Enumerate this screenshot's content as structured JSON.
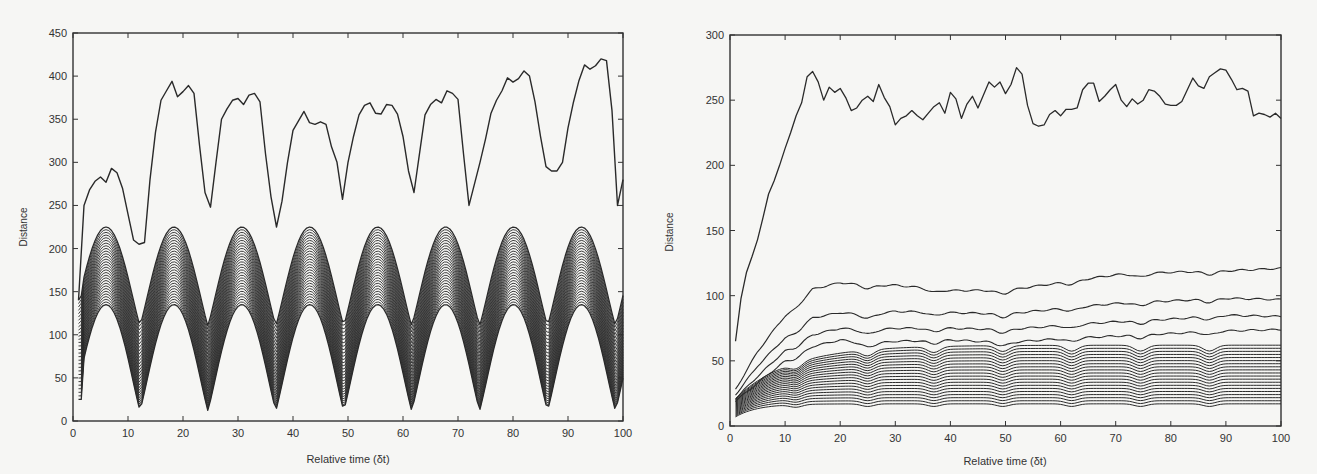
{
  "chart_data": [
    {
      "type": "line",
      "title": "",
      "xlabel": "Relative time (δt)",
      "ylabel": "Distance",
      "xlim": [
        0,
        100
      ],
      "ylim": [
        0,
        450
      ],
      "xticks": [
        0,
        10,
        20,
        30,
        40,
        50,
        60,
        70,
        80,
        90,
        100
      ],
      "yticks": [
        0,
        50,
        100,
        150,
        200,
        250,
        300,
        350,
        400,
        450
      ],
      "grid": false,
      "legend": null,
      "series": [
        {
          "name": "top curve",
          "x": [
            1,
            2,
            3,
            4,
            5,
            6,
            7,
            8,
            9,
            10,
            11,
            12,
            13,
            14,
            15,
            16,
            17,
            18,
            19,
            20,
            21,
            22,
            23,
            24,
            25,
            26,
            27,
            28,
            29,
            30,
            31,
            32,
            33,
            34,
            35,
            36,
            37,
            38,
            39,
            40,
            41,
            42,
            43,
            44,
            45,
            46,
            47,
            48,
            49,
            50,
            51,
            52,
            53,
            54,
            55,
            56,
            57,
            58,
            59,
            60,
            61,
            62,
            63,
            64,
            65,
            66,
            67,
            68,
            69,
            70,
            71,
            72,
            73,
            74,
            75,
            76,
            77,
            78,
            79,
            80,
            81,
            82,
            83,
            84,
            85,
            86,
            87,
            88,
            89,
            90,
            91,
            92,
            93,
            94,
            95,
            96,
            97,
            98,
            99,
            100
          ],
          "values": [
            140,
            250,
            268,
            278,
            283,
            277,
            293,
            288,
            270,
            240,
            210,
            205,
            207,
            280,
            335,
            372,
            383,
            394,
            376,
            382,
            389,
            380,
            320,
            265,
            248,
            300,
            350,
            362,
            372,
            374,
            367,
            378,
            380,
            370,
            310,
            260,
            225,
            255,
            300,
            337,
            348,
            359,
            346,
            344,
            347,
            344,
            318,
            300,
            257,
            300,
            330,
            355,
            366,
            369,
            357,
            356,
            367,
            366,
            356,
            330,
            290,
            265,
            310,
            355,
            367,
            373,
            369,
            383,
            380,
            373,
            310,
            250,
            275,
            300,
            327,
            357,
            372,
            383,
            398,
            393,
            397,
            406,
            400,
            370,
            330,
            295,
            290,
            290,
            300,
            340,
            370,
            395,
            413,
            408,
            412,
            420,
            418,
            360,
            250,
            280
          ]
        },
        {
          "name": "lower bundle (≈30 curves)",
          "description": "periodic band with period ≈12.3 δt; peaks ≈135–225, troughs ≈10–110",
          "peaks_x": [
            6,
            18.5,
            31,
            43.5,
            56,
            68.5,
            81,
            93.5
          ],
          "troughs_x": [
            1,
            12,
            25,
            37,
            49.5,
            62,
            74.5,
            87,
            100
          ],
          "band_peak_range": [
            135,
            225
          ],
          "band_trough_range": [
            12,
            110
          ],
          "curve_count": 30
        }
      ]
    },
    {
      "type": "line",
      "title": "",
      "xlabel": "Relative time (δt)",
      "ylabel": "Distance",
      "xlim": [
        0,
        100
      ],
      "ylim": [
        0,
        300
      ],
      "xticks": [
        0,
        10,
        20,
        30,
        40,
        50,
        60,
        70,
        80,
        90,
        100
      ],
      "yticks": [
        0,
        50,
        100,
        150,
        200,
        250,
        300
      ],
      "grid": false,
      "legend": null,
      "series": [
        {
          "name": "top curve",
          "x": [
            1,
            2,
            3,
            4,
            5,
            6,
            7,
            8,
            9,
            10,
            11,
            12,
            13,
            14,
            15,
            16,
            17,
            18,
            19,
            20,
            21,
            22,
            23,
            24,
            25,
            26,
            27,
            28,
            29,
            30,
            31,
            32,
            33,
            34,
            35,
            36,
            37,
            38,
            39,
            40,
            41,
            42,
            43,
            44,
            45,
            46,
            47,
            48,
            49,
            50,
            51,
            52,
            53,
            54,
            55,
            56,
            57,
            58,
            59,
            60,
            61,
            62,
            63,
            64,
            65,
            66,
            67,
            68,
            69,
            70,
            71,
            72,
            73,
            74,
            75,
            76,
            77,
            78,
            79,
            80,
            81,
            82,
            83,
            84,
            85,
            86,
            87,
            88,
            89,
            90,
            91,
            92,
            93,
            94,
            95,
            96,
            97,
            98,
            99,
            100
          ],
          "values": [
            65,
            98,
            118,
            130,
            143,
            160,
            178,
            188,
            200,
            213,
            225,
            238,
            248,
            268,
            272,
            264,
            250,
            260,
            256,
            259,
            252,
            242,
            244,
            250,
            253,
            249,
            262,
            252,
            245,
            231,
            236,
            238,
            242,
            238,
            235,
            240,
            245,
            248,
            240,
            256,
            251,
            236,
            247,
            253,
            244,
            254,
            264,
            260,
            264,
            255,
            262,
            275,
            270,
            246,
            232,
            230,
            231,
            239,
            242,
            238,
            243,
            243,
            244,
            258,
            263,
            263,
            249,
            253,
            258,
            262,
            250,
            245,
            251,
            247,
            250,
            258,
            257,
            253,
            247,
            246,
            246,
            249,
            258,
            267,
            261,
            259,
            268,
            271,
            274,
            273,
            266,
            258,
            259,
            257,
            238,
            240,
            239,
            237,
            240,
            236
          ]
        },
        {
          "name": "curve 2",
          "x": [
            1,
            5,
            10,
            15,
            20,
            25,
            30,
            40,
            50,
            60,
            70,
            80,
            90,
            100
          ],
          "values": [
            28,
            57,
            85,
            105,
            110,
            108,
            108,
            104,
            104,
            110,
            116,
            118,
            119,
            121
          ]
        },
        {
          "name": "curve 3",
          "x": [
            1,
            5,
            10,
            15,
            20,
            25,
            30,
            40,
            50,
            60,
            70,
            80,
            90,
            100
          ],
          "values": [
            24,
            46,
            68,
            83,
            87,
            85,
            88,
            87,
            86,
            90,
            94,
            96,
            98,
            97
          ]
        },
        {
          "name": "curve 4",
          "x": [
            1,
            5,
            10,
            15,
            20,
            25,
            30,
            40,
            50,
            60,
            70,
            80,
            90,
            100
          ],
          "values": [
            21,
            38,
            58,
            70,
            75,
            73,
            75,
            75,
            74,
            77,
            80,
            82,
            85,
            84
          ]
        },
        {
          "name": "curve 5",
          "x": [
            1,
            5,
            10,
            15,
            20,
            25,
            30,
            40,
            50,
            60,
            70,
            80,
            90,
            100
          ],
          "values": [
            19,
            33,
            50,
            61,
            66,
            63,
            65,
            66,
            64,
            67,
            69,
            71,
            73,
            74
          ]
        },
        {
          "name": "curves 6–25",
          "description": "≈20 further curves, stacked roughly evenly between ≈14 and ≈66 at x=100, dipping at x≈12, 25, 37, 49, 62, 74, 87",
          "count": 20,
          "end_range": [
            17,
            66
          ]
        }
      ]
    }
  ],
  "left": {
    "ylabel": "Distance",
    "xlabel": "Relative time (δt)",
    "yticks": [
      "0",
      "50",
      "100",
      "150",
      "200",
      "250",
      "300",
      "350",
      "400",
      "450"
    ],
    "xticks": [
      "0",
      "10",
      "20",
      "30",
      "40",
      "50",
      "60",
      "70",
      "80",
      "90",
      "100"
    ]
  },
  "right": {
    "ylabel": "Distance",
    "xlabel": "Relative time (δt)",
    "yticks": [
      "0",
      "50",
      "100",
      "150",
      "200",
      "250",
      "300"
    ],
    "xticks": [
      "0",
      "10",
      "20",
      "30",
      "40",
      "50",
      "60",
      "70",
      "80",
      "90",
      "100"
    ]
  },
  "colors": {
    "line": "#2a2a2a",
    "axis": "#333333",
    "background": "#f6f6f4"
  }
}
